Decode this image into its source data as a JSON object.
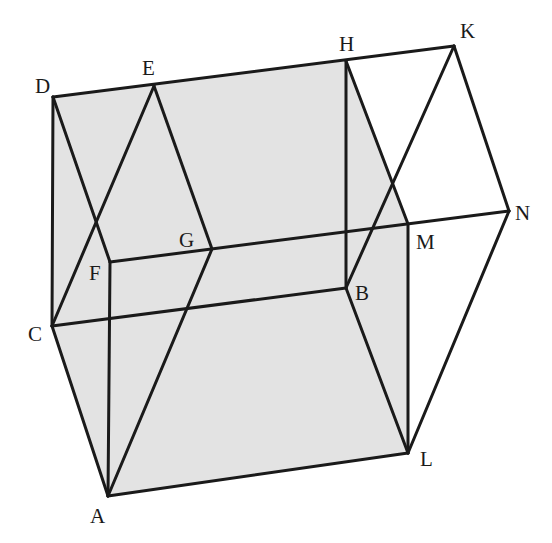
{
  "figure": {
    "type": "geometric-construction",
    "shade_color": "#e3e3e3",
    "line_color": "#1a1a1a",
    "background": "#ffffff"
  },
  "vertices": {
    "A": {
      "label": "A",
      "x": 108,
      "y": 496,
      "lx": 90,
      "ly": 523
    },
    "B": {
      "label": "B",
      "x": 346,
      "y": 288,
      "lx": 355,
      "ly": 300
    },
    "C": {
      "label": "C",
      "x": 52,
      "y": 326,
      "lx": 28,
      "ly": 341
    },
    "D": {
      "label": "D",
      "x": 53,
      "y": 97,
      "lx": 35,
      "ly": 93
    },
    "E": {
      "label": "E",
      "x": 154,
      "y": 86,
      "lx": 142,
      "ly": 75
    },
    "F": {
      "label": "F",
      "x": 110,
      "y": 262,
      "lx": 89,
      "ly": 280
    },
    "G": {
      "label": "G",
      "x": 212,
      "y": 249,
      "lx": 179,
      "ly": 247
    },
    "H": {
      "label": "H",
      "x": 346,
      "y": 61,
      "lx": 339,
      "ly": 51
    },
    "K": {
      "label": "K",
      "x": 454,
      "y": 46,
      "lx": 460,
      "ly": 38
    },
    "L": {
      "label": "L",
      "x": 408,
      "y": 453,
      "lx": 420,
      "ly": 466
    },
    "M": {
      "label": "M",
      "x": 408,
      "y": 224,
      "lx": 416,
      "ly": 249
    },
    "N": {
      "label": "N",
      "x": 509,
      "y": 211,
      "lx": 515,
      "ly": 220
    }
  },
  "shaded_region": [
    "D",
    "H",
    "M",
    "L",
    "A",
    "C"
  ],
  "edges": [
    [
      "D",
      "K"
    ],
    [
      "D",
      "C"
    ],
    [
      "C",
      "A"
    ],
    [
      "A",
      "L"
    ],
    [
      "L",
      "M"
    ],
    [
      "H",
      "M"
    ],
    [
      "H",
      "B"
    ],
    [
      "B",
      "L"
    ],
    [
      "L",
      "N"
    ],
    [
      "N",
      "K"
    ],
    [
      "D",
      "F"
    ],
    [
      "F",
      "A"
    ],
    [
      "E",
      "C"
    ],
    [
      "E",
      "G"
    ],
    [
      "G",
      "A"
    ],
    [
      "F",
      "N"
    ],
    [
      "C",
      "B"
    ],
    [
      "B",
      "K"
    ]
  ]
}
